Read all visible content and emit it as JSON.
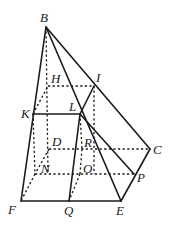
{
  "figure": {
    "type": "geometry-diagram",
    "points": {
      "B": {
        "label": "B",
        "x": 46,
        "y": 27
      },
      "H": {
        "label": "H",
        "x": 48,
        "y": 86
      },
      "I": {
        "label": "I",
        "x": 94,
        "y": 86
      },
      "K": {
        "label": "K",
        "x": 33,
        "y": 114
      },
      "L": {
        "label": "L",
        "x": 80,
        "y": 114
      },
      "D": {
        "label": "D",
        "x": 49,
        "y": 149
      },
      "R": {
        "label": "R",
        "x": 82,
        "y": 149
      },
      "C": {
        "label": "C",
        "x": 150,
        "y": 149
      },
      "N": {
        "label": "N",
        "x": 35,
        "y": 174
      },
      "O": {
        "label": "O",
        "x": 80,
        "y": 174
      },
      "P": {
        "label": "P",
        "x": 134,
        "y": 174
      },
      "F": {
        "label": "F",
        "x": 21,
        "y": 201
      },
      "Q": {
        "label": "Q",
        "x": 69,
        "y": 201
      },
      "E": {
        "label": "E",
        "x": 121,
        "y": 201
      }
    },
    "solid_edges": [
      "B-F",
      "B-E",
      "B-C",
      "K-L",
      "L-I",
      "L-Q",
      "L-P",
      "F-E",
      "C-E"
    ],
    "dashed_edges": [
      "B-N",
      "H-I",
      "K-H",
      "K-N",
      "D-C",
      "D-N",
      "N-F",
      "N-P",
      "I-O",
      "L-R",
      "R-O",
      "O-Q"
    ]
  }
}
